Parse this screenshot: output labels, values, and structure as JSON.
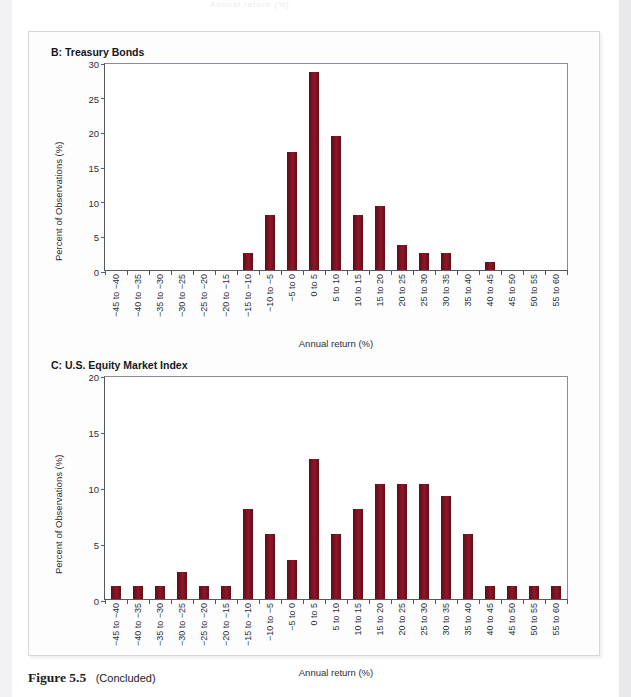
{
  "page": {
    "top_cutoff_text": "Annual return (%)",
    "caption_number": "Figure 5.5",
    "caption_suffix": "(Concluded)"
  },
  "colors": {
    "bar": "#7d1322",
    "axis": "#55585e",
    "panel_bg": "#fdfdfe",
    "page_bg": "#ffffff",
    "text": "#1c1c1c"
  },
  "chart_data": [
    {
      "type": "bar",
      "panel_label": "B",
      "title": "B: Treasury Bonds",
      "xlabel": "Annual return (%)",
      "ylabel": "Percent of Observations (%)",
      "ylim": [
        0,
        30
      ],
      "yticks": [
        0,
        5,
        10,
        15,
        20,
        25,
        30
      ],
      "grid": false,
      "legend": "none",
      "categories": [
        "−45 to −40",
        "−40 to −35",
        "−35 to −30",
        "−30 to −25",
        "−25 to −20",
        "−20 to −15",
        "−15 to −10",
        "−10 to −5",
        "−5 to 0",
        "0 to 5",
        "5 to 10",
        "10 to 15",
        "15 to 20",
        "20 to 25",
        "25 to 30",
        "30 to 35",
        "35 to 40",
        "40 to 45",
        "45 to 50",
        "50 to 55",
        "55 to 60"
      ],
      "values": [
        0,
        0,
        0,
        0,
        0,
        0,
        2.4,
        8.0,
        17.0,
        28.5,
        19.4,
        8.0,
        9.3,
        3.6,
        2.4,
        2.4,
        0,
        1.2,
        0,
        0,
        0
      ]
    },
    {
      "type": "bar",
      "panel_label": "C",
      "title": "C: U.S. Equity Market Index",
      "xlabel": "Annual return (%)",
      "ylabel": "Percent of Observations (%)",
      "ylim": [
        0,
        20
      ],
      "yticks": [
        0,
        5,
        10,
        15,
        20
      ],
      "grid": false,
      "legend": "none",
      "categories": [
        "−45 to −40",
        "−40 to −35",
        "−35 to −30",
        "−30 to −25",
        "−25 to −20",
        "−20 to −15",
        "−15 to −10",
        "−10 to −5",
        "−5 to 0",
        "0 to 5",
        "5 to 10",
        "10 to 15",
        "15 to 20",
        "20 to 25",
        "25 to 30",
        "30 to 35",
        "35 to 40",
        "40 to 45",
        "45 to 50",
        "50 to 55",
        "55 to 60"
      ],
      "values": [
        1.2,
        1.2,
        1.2,
        2.4,
        1.2,
        1.2,
        8.0,
        5.8,
        3.5,
        12.5,
        5.8,
        8.0,
        10.3,
        10.3,
        10.3,
        9.2,
        5.8,
        1.2,
        1.2,
        1.2,
        1.2
      ]
    }
  ]
}
